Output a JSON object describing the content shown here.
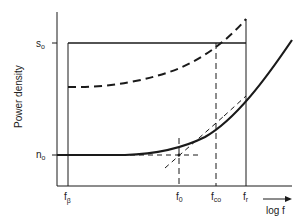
{
  "diagram": {
    "ylabel": "Power density",
    "xlabel": "log f",
    "y_ticks": {
      "s0": {
        "base": "s",
        "sub": "o"
      },
      "n0": {
        "base": "n",
        "sub": "o"
      }
    },
    "x_ticks": {
      "f_beta": {
        "base": "f",
        "sub": "β"
      },
      "f_0": {
        "base": "f",
        "sub": "0"
      },
      "f_co": {
        "base": "f",
        "sub": "co"
      },
      "f_r": {
        "base": "f",
        "sub": "r"
      }
    },
    "colors": {
      "line": "#1a1a1a",
      "background": "#ffffff"
    }
  }
}
